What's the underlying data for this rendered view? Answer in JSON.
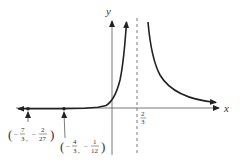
{
  "diagram": {
    "type": "function-graph",
    "axes": {
      "x_label": "x",
      "y_label": "y"
    },
    "asymptote": {
      "x_value": "2/3",
      "numerator": "2",
      "denominator": "3"
    },
    "points": [
      {
        "label": "(−7/3, −2/27)",
        "x": {
          "sign": "−",
          "num": "7",
          "den": "3"
        },
        "y": {
          "sign": "−",
          "num": "2",
          "den": "27"
        }
      },
      {
        "label": "(−4/3, −1/12)",
        "x": {
          "sign": "−",
          "num": "4",
          "den": "3"
        },
        "y": {
          "sign": "−",
          "num": "1",
          "den": "12"
        }
      }
    ]
  }
}
